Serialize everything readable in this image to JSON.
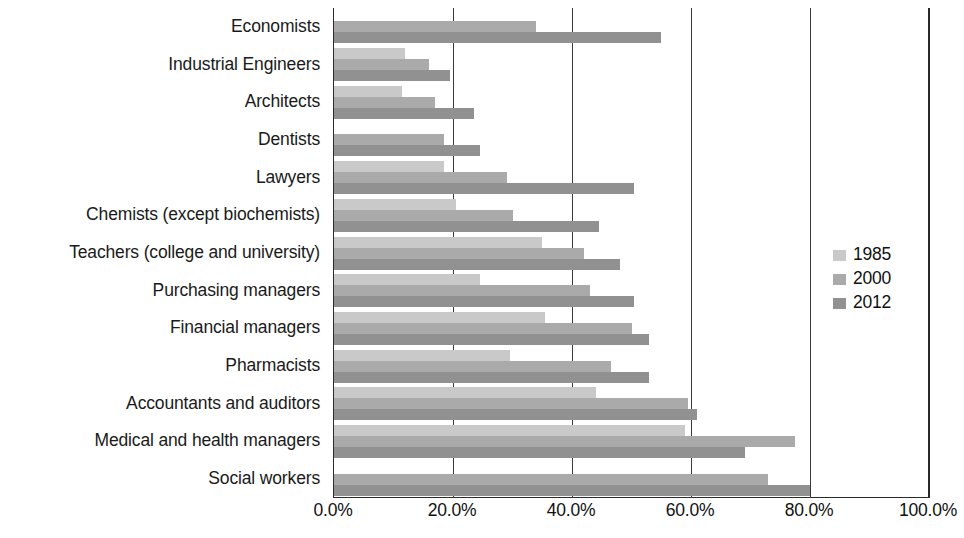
{
  "chart_data": {
    "type": "bar",
    "orientation": "horizontal",
    "title": "",
    "xlabel": "",
    "ylabel": "",
    "xlim": [
      0,
      100
    ],
    "xtick_labels": [
      "0.0%",
      "20.0%",
      "40.0%",
      "60.0%",
      "80.0%",
      "100.0%"
    ],
    "xtick_values": [
      0,
      20,
      40,
      60,
      80,
      100
    ],
    "grid": true,
    "legend_position": "right",
    "categories": [
      "Economists",
      "Industrial Engineers",
      "Architects",
      "Dentists",
      "Lawyers",
      "Chemists (except biochemists)",
      "Teachers (college and university)",
      "Purchasing managers",
      "Financial managers",
      "Pharmacists",
      "Accountants and auditors",
      "Medical and health managers",
      "Social workers"
    ],
    "series": [
      {
        "name": "1985",
        "color": "#c9c9c9",
        "values": [
          null,
          12.0,
          11.5,
          0,
          18.5,
          20.5,
          35.0,
          24.5,
          35.5,
          29.5,
          44.0,
          59.0,
          null
        ]
      },
      {
        "name": "2000",
        "color": "#aaaaaa",
        "values": [
          34.0,
          16.0,
          17.0,
          18.5,
          29.0,
          30.0,
          42.0,
          43.0,
          50.0,
          46.5,
          59.5,
          77.5,
          73.0
        ]
      },
      {
        "name": "2012",
        "color": "#919191",
        "values": [
          55.0,
          19.5,
          23.5,
          24.5,
          50.5,
          44.5,
          48.0,
          50.5,
          53.0,
          53.0,
          61.0,
          69.0,
          80.0
        ]
      }
    ],
    "legend": [
      "1985",
      "2000",
      "2012"
    ]
  },
  "colors": {
    "series_1985": "#c9c9c9",
    "series_2000": "#aaaaaa",
    "series_2012": "#919191",
    "axis": "#2a2a2a",
    "gridline": "#3a3a3a",
    "text": "#1a1a1a",
    "background": "#ffffff"
  }
}
